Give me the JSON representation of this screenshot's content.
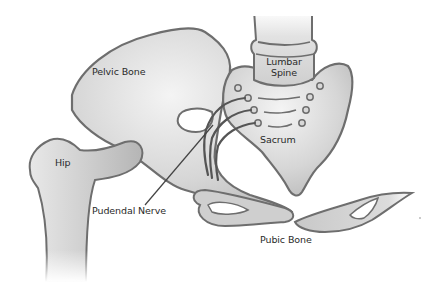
{
  "diagram": {
    "colors": {
      "bone_fill_light": "#f2f2f2",
      "bone_fill_dark": "#bdbdbd",
      "outline": "#6e6e6e",
      "nerve_line": "#444444",
      "label_text": "#2a2a2a",
      "background": "#ffffff"
    },
    "labels": {
      "pelvic_bone": "Pelvic Bone",
      "lumbar_spine_line1": "Lumbar",
      "lumbar_spine_line2": "Spine",
      "sacrum": "Sacrum",
      "hip": "Hip",
      "pudendal_nerve": "Pudendal Nerve",
      "pubic_bone": "Pubic Bone"
    }
  }
}
